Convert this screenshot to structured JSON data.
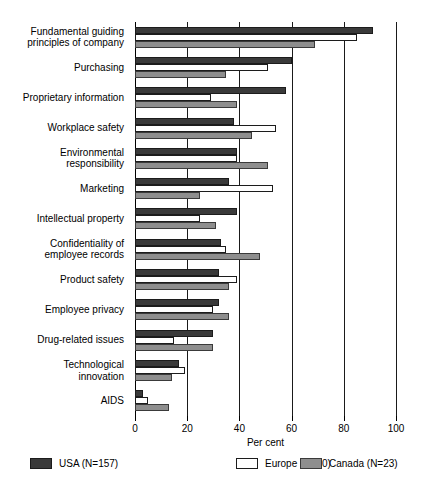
{
  "chart_data": {
    "type": "bar",
    "orientation": "horizontal",
    "title": "",
    "xlabel": "Per cent",
    "ylabel": "",
    "xlim": [
      0,
      100
    ],
    "xticks": [
      0,
      20,
      40,
      60,
      80,
      100
    ],
    "grid": true,
    "grid_axis": "x",
    "legend_position": "bottom",
    "categories": [
      "Fundamental guiding principles of company",
      "Purchasing",
      "Proprietary information",
      "Workplace safety",
      "Environmental responsibility",
      "Marketing",
      "Intellectual property",
      "Confidentiality of employee records",
      "Product safety",
      "Employee privacy",
      "Drug-related issues",
      "Technological innovation",
      "AIDS"
    ],
    "series": [
      {
        "name": "USA (N=157)",
        "color": "#3a3a3a",
        "values": [
          91,
          60,
          58,
          38,
          39,
          36,
          39,
          33,
          32,
          32,
          30,
          17,
          3
        ]
      },
      {
        "name": "Europe (N=20)",
        "color": "#ffffff",
        "values": [
          85,
          51,
          29,
          54,
          39,
          53,
          25,
          35,
          39,
          30,
          15,
          19,
          5
        ]
      },
      {
        "name": "Canada (N=23)",
        "color": "#8e8e8e",
        "values": [
          69,
          35,
          39,
          45,
          51,
          25,
          31,
          48,
          36,
          36,
          30,
          14,
          13
        ]
      }
    ]
  },
  "category_labels": [
    [
      "Fundamental guiding",
      "principles of company"
    ],
    [
      "Purchasing"
    ],
    [
      "Proprietary information"
    ],
    [
      "Workplace safety"
    ],
    [
      "Environmental",
      "responsibility"
    ],
    [
      "Marketing"
    ],
    [
      "Intellectual property"
    ],
    [
      "Confidentiality of",
      "employee records"
    ],
    [
      "Product safety"
    ],
    [
      "Employee privacy"
    ],
    [
      "Drug-related issues"
    ],
    [
      "Technological",
      "innovation"
    ],
    [
      "AIDS"
    ]
  ],
  "axis": {
    "tick_labels": [
      "0",
      "20",
      "40",
      "60",
      "80",
      "100"
    ],
    "title": "Per cent"
  },
  "legend": {
    "items": [
      {
        "label": "USA (N=157)",
        "swatch": "usa"
      },
      {
        "label": "Europe (N=20)",
        "swatch": "europe"
      },
      {
        "label": "Canada (N=23)",
        "swatch": "canada"
      }
    ]
  }
}
